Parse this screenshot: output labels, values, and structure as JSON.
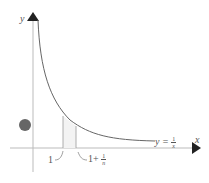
{
  "diagram": {
    "title": "",
    "axes": {
      "x_label": "x",
      "y_label": "y"
    },
    "curve": {
      "label_lhs": "y =",
      "label_num": "1",
      "label_den": "x",
      "color": "#666666"
    },
    "ticks": [
      {
        "label": "1"
      },
      {
        "label_prefix": "1+",
        "label_num": "1",
        "label_den": "n"
      }
    ],
    "marker_color": "#666666"
  }
}
